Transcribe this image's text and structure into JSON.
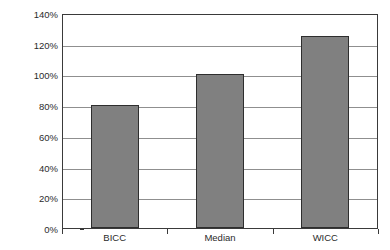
{
  "chart_data": {
    "type": "bar",
    "title": "",
    "subtitle": "",
    "xlabel": "",
    "ylabel": "Percentage of Industry Average",
    "categories": [
      "BICC",
      "Median",
      "WICC"
    ],
    "values": [
      80,
      100,
      125
    ],
    "value_labels": [
      "80%",
      "100%",
      "125%"
    ],
    "ylim": [
      0,
      140
    ],
    "ytick_values": [
      0,
      20,
      40,
      60,
      80,
      100,
      120,
      140
    ],
    "ytick_labels": [
      "0%",
      "20%",
      "40%",
      "60%",
      "80%",
      "100%",
      "120%",
      "140%"
    ],
    "grid": true,
    "grid_axis": "y",
    "legend": false,
    "legend_position": "none",
    "annotations": [],
    "series": [
      {
        "name": "Percentage of Industry Average",
        "values": [
          80,
          100,
          125
        ]
      }
    ]
  },
  "style": {
    "bar_fill": "#808080",
    "bar_border": "#2e2e2e",
    "gridline_color": "#8f8f8f",
    "axis_color": "#3a3a3a",
    "text_color": "#2b2b2b",
    "background": "#ffffff"
  }
}
